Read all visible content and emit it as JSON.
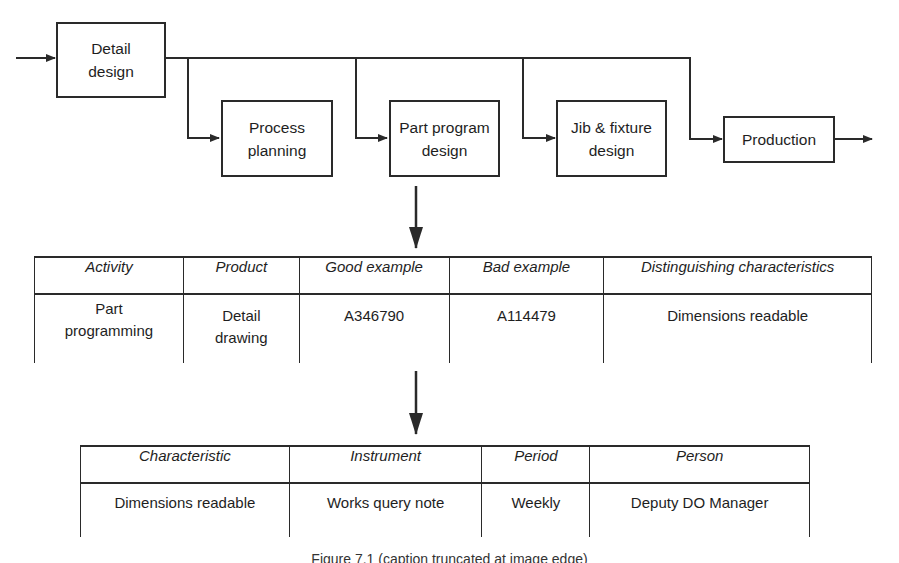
{
  "flow": {
    "boxes": [
      {
        "id": "detail-design",
        "label": "Detail\ndesign"
      },
      {
        "id": "process-planning",
        "label": "Process\nplanning"
      },
      {
        "id": "part-program-design",
        "label": "Part program\ndesign"
      },
      {
        "id": "jib-fixture-design",
        "label": "Jib & fixture\ndesign"
      },
      {
        "id": "production",
        "label": "Production"
      }
    ]
  },
  "table1": {
    "headers": [
      "Activity",
      "Product",
      "Good example",
      "Bad example",
      "Distinguishing characteristics"
    ],
    "rows": [
      [
        "Part\nprogramming",
        "Detail\ndrawing",
        "A346790",
        "A114479",
        "Dimensions readable"
      ]
    ]
  },
  "table2": {
    "headers": [
      "Characteristic",
      "Instrument",
      "Period",
      "Person"
    ],
    "rows": [
      [
        "Dimensions readable",
        "Works query note",
        "Weekly",
        "Deputy DO Manager"
      ]
    ]
  },
  "caption": {
    "text": "Figure 7.1 (caption truncated at image edge)"
  },
  "colors": {
    "line": "#2a2a2a",
    "background": "#ffffff"
  }
}
